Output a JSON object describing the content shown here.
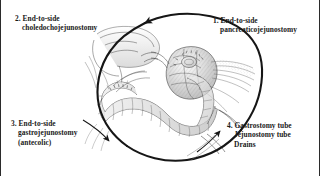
{
  "figure": {
    "title": "Whipple pancreaticoduodenectomy reconstruction diagram",
    "background_color": "#ffffff",
    "ink_color": "#1a1a1a",
    "border_color": "#2b2b2b"
  },
  "illustration": {
    "name": "pancreaticoduodenectomy-reconstruction",
    "description": "Pen-and-ink anatomical drawing of the reconstructed upper abdomen after a Whipple procedure, showing the jejunal limb anastomosed to the pancreas, bile duct and stomach, encircled by a counterclockwise arrow."
  },
  "labels": [
    {
      "id": "label-1",
      "number": "1.",
      "lines": [
        "End-to-side",
        "pancreaticojejunostomy"
      ],
      "position": "top-right"
    },
    {
      "id": "label-2",
      "number": "2.",
      "lines": [
        "End-to-side",
        "choledochojejunostomy"
      ],
      "position": "top-left"
    },
    {
      "id": "label-3",
      "number": "3.",
      "lines": [
        "End-to-side",
        "gastrojejunostomy",
        "(antecolic)"
      ],
      "position": "bottom-left"
    },
    {
      "id": "label-4",
      "number": "4.",
      "lines": [
        "Gastrostomy tube",
        "Jejunostomy tube",
        "Drains"
      ],
      "position": "bottom-right"
    }
  ],
  "annotations": {
    "flow_arrow": "counterclockwise-circular-arrow",
    "leader_3": "arrow pointing down-right from label 3 to gastrojejunostomy",
    "leader_4": "arrow pointing up-right from label 4 to tubes and drains"
  }
}
